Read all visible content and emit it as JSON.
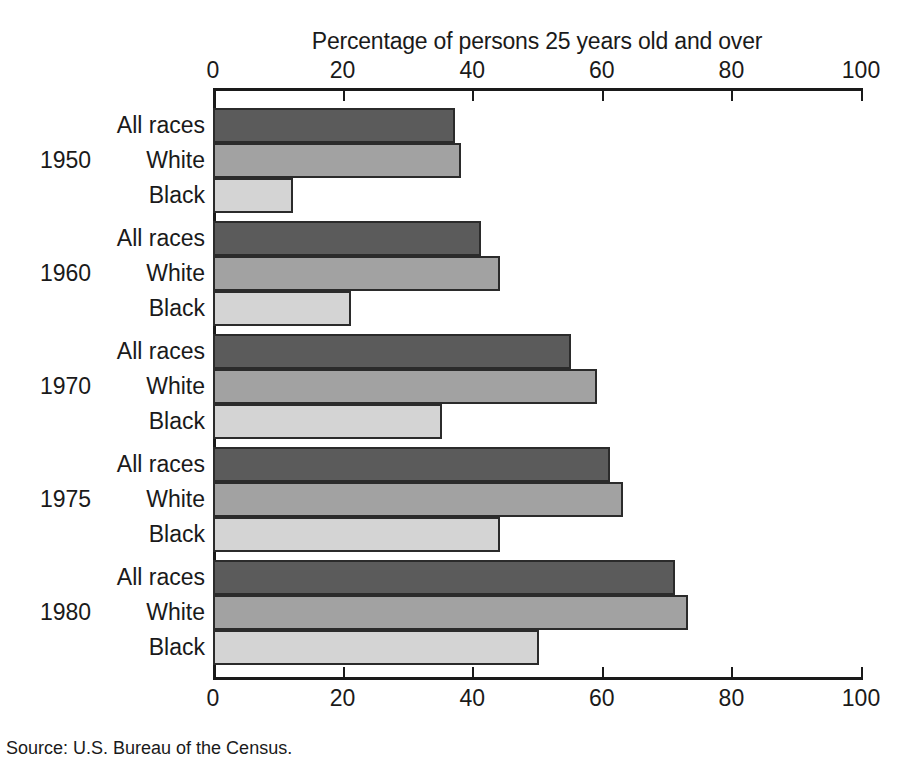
{
  "chart_data": {
    "type": "bar",
    "orientation": "horizontal",
    "title": "",
    "xlabel": "Percentage of persons 25 years old and over",
    "ylabel": "",
    "xlim": [
      0,
      100
    ],
    "xticks": [
      0,
      20,
      40,
      60,
      80,
      100
    ],
    "xtick_labels": [
      "0",
      "20",
      "40",
      "60",
      "80",
      "100"
    ],
    "grid": false,
    "legend": "none",
    "categories": [
      "1950",
      "1960",
      "1970",
      "1975",
      "1980"
    ],
    "series": [
      {
        "name": "All races",
        "color": "#5b5b5b",
        "values": [
          37,
          41,
          55,
          61,
          71
        ]
      },
      {
        "name": "White",
        "color": "#a2a2a2",
        "values": [
          38,
          44,
          59,
          63,
          73
        ]
      },
      {
        "name": "Black",
        "color": "#d4d4d4",
        "values": [
          12,
          21,
          35,
          44,
          50
        ]
      }
    ],
    "groups": [
      {
        "year": "1950",
        "bars": [
          {
            "label": "All races",
            "value": 37,
            "style": "all"
          },
          {
            "label": "White",
            "value": 38,
            "style": "white"
          },
          {
            "label": "Black",
            "value": 12,
            "style": "black"
          }
        ]
      },
      {
        "year": "1960",
        "bars": [
          {
            "label": "All races",
            "value": 41,
            "style": "all"
          },
          {
            "label": "White",
            "value": 44,
            "style": "white"
          },
          {
            "label": "Black",
            "value": 21,
            "style": "black"
          }
        ]
      },
      {
        "year": "1970",
        "bars": [
          {
            "label": "All races",
            "value": 55,
            "style": "all"
          },
          {
            "label": "White",
            "value": 59,
            "style": "white"
          },
          {
            "label": "Black",
            "value": 35,
            "style": "black"
          }
        ]
      },
      {
        "year": "1975",
        "bars": [
          {
            "label": "All races",
            "value": 61,
            "style": "all"
          },
          {
            "label": "White",
            "value": 63,
            "style": "white"
          },
          {
            "label": "Black",
            "value": 44,
            "style": "black"
          }
        ]
      },
      {
        "year": "1980",
        "bars": [
          {
            "label": "All races",
            "value": 71,
            "style": "all"
          },
          {
            "label": "White",
            "value": 73,
            "style": "white"
          },
          {
            "label": "Black",
            "value": 50,
            "style": "black"
          }
        ]
      }
    ],
    "source": "Source: U.S. Bureau of the Census."
  },
  "colors": {
    "all_races": "#5b5b5b",
    "white": "#a2a2a2",
    "black": "#d4d4d4",
    "axis": "#1a1a1a",
    "background": "#ffffff"
  }
}
